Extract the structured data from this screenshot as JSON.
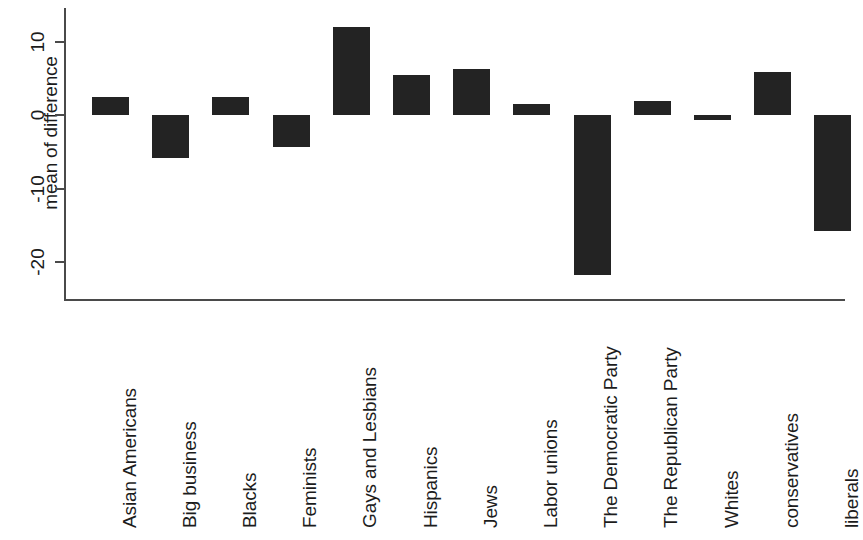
{
  "chart_data": {
    "type": "bar",
    "title": "",
    "xlabel": "",
    "ylabel": "mean of difference",
    "ylim": [
      -25.5,
      14.0
    ],
    "yticks": [
      10,
      0,
      -10,
      -20
    ],
    "ytick_labels": [
      "10",
      "0",
      "-10",
      "-20"
    ],
    "grid": false,
    "legend": null,
    "orientation": "vertical",
    "bar_color": "#232323",
    "axis_color": "#4a4a4a",
    "background": "#ffffff",
    "categories": [
      "Asian Americans",
      "Big business",
      "Blacks",
      "Feminists",
      "Gays and Lesbians",
      "Hispanics",
      "Jews",
      "Labor unions",
      "The Democratic Party",
      "The Republican Party",
      "Whites",
      "conservatives",
      "liberals"
    ],
    "values": [
      2.4,
      -5.8,
      2.5,
      -4.4,
      12.0,
      5.5,
      6.3,
      1.5,
      -21.8,
      1.9,
      -0.7,
      5.8,
      -15.8
    ]
  }
}
